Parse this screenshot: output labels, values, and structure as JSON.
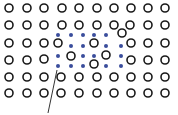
{
  "diagram": {
    "colors": {
      "background": "#ffffff",
      "host_atom_stroke": "#1a1a1a",
      "solute_atom_fill": "#3a4d9c",
      "pointer_line": "#333333"
    },
    "host_atom_radius": 4,
    "solute_atom_radius": 2,
    "host_atoms": [
      [
        9,
        8
      ],
      [
        27,
        8
      ],
      [
        44,
        8
      ],
      [
        62,
        8
      ],
      [
        79,
        8
      ],
      [
        97,
        8
      ],
      [
        114,
        8
      ],
      [
        131,
        8
      ],
      [
        148,
        8
      ],
      [
        165,
        8
      ],
      [
        9,
        25
      ],
      [
        27,
        25
      ],
      [
        44,
        25
      ],
      [
        62,
        25
      ],
      [
        79,
        25
      ],
      [
        97,
        25
      ],
      [
        114,
        25
      ],
      [
        130,
        25
      ],
      [
        148,
        25
      ],
      [
        165,
        25
      ],
      [
        122,
        33
      ],
      [
        9,
        43
      ],
      [
        27,
        43
      ],
      [
        44,
        43
      ],
      [
        58,
        43
      ],
      [
        94,
        43
      ],
      [
        131,
        43
      ],
      [
        148,
        43
      ],
      [
        165,
        43
      ],
      [
        9,
        60
      ],
      [
        27,
        60
      ],
      [
        44,
        59
      ],
      [
        71,
        56
      ],
      [
        106,
        55
      ],
      [
        131,
        60
      ],
      [
        148,
        60
      ],
      [
        165,
        60
      ],
      [
        94,
        64
      ],
      [
        9,
        77
      ],
      [
        27,
        77
      ],
      [
        44,
        77
      ],
      [
        61,
        77
      ],
      [
        79,
        77
      ],
      [
        97,
        77
      ],
      [
        114,
        77
      ],
      [
        131,
        77
      ],
      [
        148,
        77
      ],
      [
        165,
        77
      ],
      [
        9,
        93
      ],
      [
        27,
        93
      ],
      [
        44,
        93
      ],
      [
        61,
        93
      ],
      [
        79,
        93
      ],
      [
        97,
        93
      ],
      [
        114,
        93
      ],
      [
        131,
        93
      ],
      [
        148,
        93
      ],
      [
        165,
        93
      ]
    ],
    "solute_atoms": [
      [
        58,
        35
      ],
      [
        71,
        35
      ],
      [
        83,
        35
      ],
      [
        94,
        35
      ],
      [
        106,
        35
      ],
      [
        71,
        46
      ],
      [
        83,
        46
      ],
      [
        106,
        46
      ],
      [
        121,
        46
      ],
      [
        58,
        56
      ],
      [
        83,
        56
      ],
      [
        94,
        56
      ],
      [
        121,
        56
      ],
      [
        58,
        66
      ],
      [
        71,
        66
      ],
      [
        83,
        66
      ],
      [
        106,
        66
      ],
      [
        121,
        66
      ]
    ],
    "pointer": {
      "x1": 57,
      "y1": 70,
      "x2": 48,
      "y2": 113
    }
  }
}
